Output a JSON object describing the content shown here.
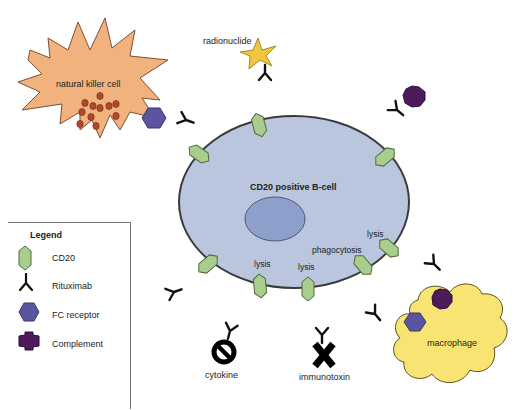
{
  "diagram": {
    "colors": {
      "b_cell_fill": "#b9c6de",
      "b_cell_stroke": "#3a3a3a",
      "nucleus_fill": "#8f9fcb",
      "cd20_fill": "#a9cd8c",
      "nk_cell_fill": "#f2b27e",
      "granule_fill": "#b0492a",
      "fc_receptor_fill": "#5a559e",
      "complement_fill": "#4d1a5b",
      "macrophage_fill": "#f8e472",
      "radionuclide_fill": "#f0c73c",
      "antibody_stroke": "#111111"
    },
    "labels": {
      "b_cell": "CD20 positive B-cell",
      "nk_cell": "natural killer cell",
      "radionuclide": "radionuclide",
      "macrophage": "macrophage",
      "cytokine": "cytokine",
      "immunotoxin": "immunotoxin",
      "lysis_1": "lysis",
      "lysis_2": "lysis",
      "lysis_3": "lysis",
      "phagocytosis": "phagocytosis"
    }
  },
  "legend": {
    "title": "Legend",
    "items": [
      {
        "symbol": "cd20-icon",
        "label": "CD20"
      },
      {
        "symbol": "rituximab-icon",
        "label": "Rituximab"
      },
      {
        "symbol": "fc-receptor-icon",
        "label": "FC receptor"
      },
      {
        "symbol": "complement-icon",
        "label": "Complement"
      }
    ]
  }
}
